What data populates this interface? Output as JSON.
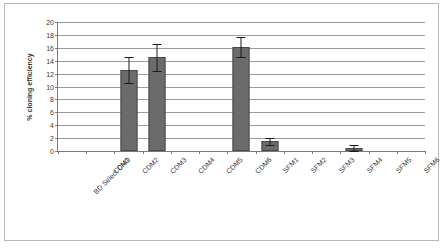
{
  "chart_data": {
    "type": "bar",
    "title": "",
    "xlabel": "",
    "ylabel": "% cloning efficiency",
    "ylim": [
      0,
      20
    ],
    "ytick_step": 2,
    "yticks": [
      0,
      2,
      4,
      6,
      8,
      10,
      12,
      14,
      16,
      18,
      20
    ],
    "ytick_labels": [
      "0",
      "2",
      "4",
      "6",
      "8",
      "10",
      "12",
      "14",
      "16",
      "18",
      "20"
    ],
    "grid": "horizontal",
    "legend": "none",
    "bar_color": "#6b6b6b",
    "bar_edge_color": "#4a4a4a",
    "error_color": "#1a1a1a",
    "gridline_color": "#9b9b9b",
    "axis_color": "#7a7a7a",
    "categories": [
      "BD Select CHO",
      "CDM1",
      "CDM2",
      "CDM3",
      "CDM4",
      "CDM5",
      "CDM6",
      "SFM1",
      "SFM2",
      "SFM3",
      "SFM4",
      "SFM5",
      "SFM6"
    ],
    "values": [
      0,
      0,
      12.5,
      14.5,
      0,
      0,
      16.1,
      1.5,
      0,
      0,
      0.45,
      0,
      0
    ],
    "errors": [
      0,
      0,
      2.0,
      2.05,
      0,
      0,
      1.6,
      0.55,
      0,
      0,
      0.45,
      0,
      0
    ],
    "error_low": [
      0,
      0,
      10.5,
      12.45,
      0,
      0,
      14.5,
      0.95,
      0,
      0,
      0.0,
      0,
      0
    ],
    "error_high": [
      0,
      0,
      14.5,
      16.55,
      0,
      0,
      17.7,
      2.05,
      0,
      0,
      0.9,
      0,
      0
    ]
  }
}
